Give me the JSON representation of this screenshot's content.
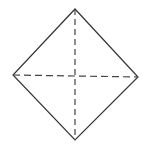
{
  "diagram": {
    "type": "square-with-dashed-diagonals",
    "vertices": {
      "top": [
        75,
        9
      ],
      "right": [
        138,
        77
      ],
      "bottom": [
        75,
        140
      ],
      "left": [
        13,
        75
      ]
    },
    "outline": {
      "style": "solid",
      "color": "#333333"
    },
    "diagonals": [
      {
        "from": "top",
        "to": "bottom",
        "style": "dashed",
        "color": "#444444"
      },
      {
        "from": "left",
        "to": "right",
        "style": "dashed",
        "color": "#444444"
      }
    ]
  }
}
